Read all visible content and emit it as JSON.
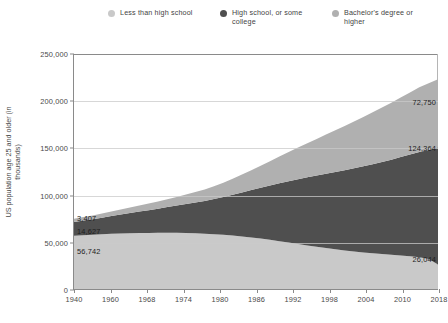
{
  "legend": {
    "items": [
      {
        "label": "Less than high school",
        "color": "#c9c9c9",
        "key": "less-than-high-school"
      },
      {
        "label": "High school, or some college",
        "color": "#4f4f4f",
        "key": "high-school-some-college"
      },
      {
        "label": "Bachelor's degree or higher",
        "color": "#b0b0b0",
        "key": "bachelors-degree-or-higher"
      }
    ]
  },
  "axes": {
    "y_label": "US population age 25 and older (in thousands)",
    "y_ticks": [
      "0",
      "50,000",
      "100,000",
      "150,000",
      "200,000",
      "250,000"
    ],
    "x_ticks": [
      "1940",
      "1960",
      "1968",
      "1974",
      "1980",
      "1986",
      "1992",
      "1998",
      "2004",
      "2010",
      "2018"
    ]
  },
  "annotations": [
    {
      "text": "3,407",
      "series": "bachelors-degree-or-higher",
      "side": "left",
      "x": 1940,
      "y": 76500
    },
    {
      "text": "14,627",
      "series": "high-school-some-college",
      "side": "left",
      "x": 1940,
      "y": 62000
    },
    {
      "text": "56,742",
      "series": "less-than-high-school",
      "side": "left",
      "x": 1940,
      "y": 41000
    },
    {
      "text": "72,750",
      "series": "bachelors-degree-or-higher",
      "side": "right",
      "x": 2018,
      "y": 199000
    },
    {
      "text": "124,364",
      "series": "high-school-some-college",
      "side": "right",
      "x": 2018,
      "y": 150000
    },
    {
      "text": "26,044",
      "series": "less-than-high-school",
      "side": "right",
      "x": 2018,
      "y": 33000
    }
  ],
  "chart_data": {
    "type": "area",
    "stacked": true,
    "title": "",
    "xlabel": "",
    "ylabel": "US population age 25 and older (in thousands)",
    "xlim": [
      1940,
      2018
    ],
    "ylim": [
      0,
      250000
    ],
    "grid": true,
    "legend_position": "top",
    "x": [
      1940,
      1942,
      1944,
      1946,
      1948,
      1950,
      1952,
      1954,
      1956,
      1958,
      1960,
      1962,
      1964,
      1966,
      1968,
      1970,
      1972,
      1974,
      1976,
      1978,
      1980,
      1982,
      1984,
      1986,
      1988,
      1990,
      1992,
      1994,
      1996,
      1998,
      2000,
      2002,
      2004,
      2006,
      2008,
      2010,
      2012,
      2014,
      2016,
      2018
    ],
    "series": [
      {
        "name": "Less than high school",
        "key": "less-than-high-school",
        "color": "#c9c9c9",
        "stack_order": 0,
        "values": [
          56742,
          57200,
          57700,
          58200,
          58700,
          59100,
          59400,
          59600,
          59700,
          59800,
          59900,
          59800,
          59600,
          59300,
          58900,
          58300,
          57600,
          56800,
          55900,
          54900,
          53700,
          52300,
          50900,
          49400,
          47900,
          46400,
          44900,
          43500,
          42200,
          41000,
          39900,
          38900,
          38000,
          37200,
          36400,
          35700,
          34900,
          33800,
          31800,
          26044
        ]
      },
      {
        "name": "High school, or some college",
        "key": "high-school-some-college",
        "color": "#4f4f4f",
        "stack_order": 1,
        "values": [
          14627,
          15600,
          16600,
          17700,
          18900,
          20100,
          21400,
          22800,
          24200,
          25700,
          27300,
          29000,
          30800,
          32700,
          34800,
          37400,
          40300,
          43400,
          46800,
          50300,
          54000,
          57800,
          61600,
          65300,
          68900,
          72400,
          75800,
          79100,
          82300,
          85400,
          88500,
          91600,
          94700,
          97900,
          101200,
          104600,
          108200,
          112000,
          116200,
          124364
        ]
      },
      {
        "name": "Bachelor's degree or higher",
        "key": "bachelors-degree-or-higher",
        "color": "#b0b0b0",
        "stack_order": 2,
        "values": [
          3407,
          3700,
          4000,
          4400,
          4800,
          5300,
          5800,
          6400,
          7000,
          7700,
          8400,
          9200,
          10100,
          11100,
          12200,
          13600,
          15200,
          17000,
          19000,
          21200,
          23500,
          25900,
          28400,
          31000,
          33600,
          36300,
          39000,
          41700,
          44400,
          47100,
          49800,
          52500,
          55200,
          57900,
          60600,
          63300,
          66000,
          68700,
          71000,
          72750
        ]
      }
    ]
  }
}
